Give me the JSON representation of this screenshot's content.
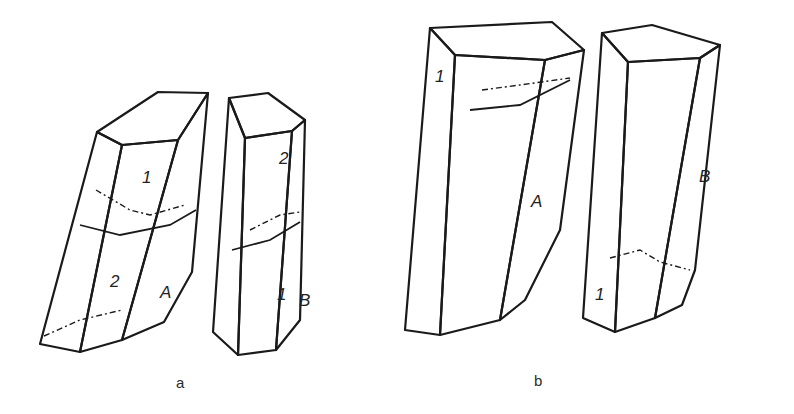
{
  "figure": {
    "subfigures": [
      {
        "label": "a",
        "crystals": [
          {
            "id": "a-A",
            "label": "A",
            "twin_parts": [
              "1",
              "2"
            ]
          },
          {
            "id": "a-B",
            "label": "B",
            "twin_parts": [
              "2",
              "1"
            ]
          }
        ]
      },
      {
        "label": "b",
        "crystals": [
          {
            "id": "b-A",
            "label": "A",
            "twin_parts": [
              "1"
            ]
          },
          {
            "id": "b-B",
            "label": "B",
            "twin_parts": [
              "1"
            ]
          }
        ]
      }
    ]
  },
  "colors": {
    "ink": "#1a1a1a",
    "background": "#ffffff"
  }
}
